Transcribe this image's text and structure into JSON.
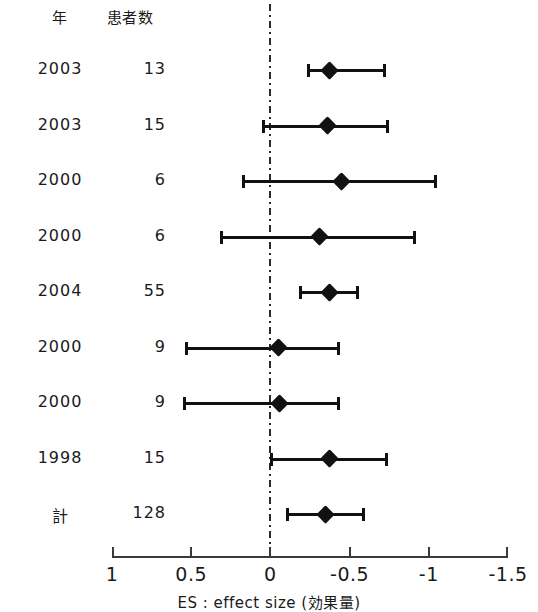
{
  "chart_data": {
    "type": "scatter",
    "subtype": "forest-plot",
    "title": "",
    "xlabel": "ES : effect size (効果量)",
    "ylabel": "",
    "xlim": [
      1,
      -1.5
    ],
    "x_reversed": true,
    "xticks": [
      1,
      0.5,
      0,
      -0.5,
      -1,
      -1.5
    ],
    "xticklabels": [
      "1",
      "0.5",
      "0",
      "-0.5",
      "-1",
      "-1.5"
    ],
    "grid": false,
    "legend": false,
    "reference_line": {
      "value": 0,
      "style": "dash-dot"
    },
    "columns": [
      "年",
      "患者数"
    ],
    "rows": [
      {
        "year": "2003",
        "n": "13",
        "estimate": -0.37,
        "ci_low": -0.23,
        "ci_high": -0.73,
        "is_total": false
      },
      {
        "year": "2003",
        "n": "15",
        "estimate": -0.36,
        "ci_low": 0.05,
        "ci_high": -0.75,
        "is_total": false
      },
      {
        "year": "2000",
        "n": "6",
        "estimate": -0.45,
        "ci_low": 0.18,
        "ci_high": -1.05,
        "is_total": false
      },
      {
        "year": "2000",
        "n": "6",
        "estimate": -0.31,
        "ci_low": 0.32,
        "ci_high": -0.92,
        "is_total": false
      },
      {
        "year": "2004",
        "n": "55",
        "estimate": -0.37,
        "ci_low": -0.18,
        "ci_high": -0.56,
        "is_total": false
      },
      {
        "year": "2000",
        "n": "9",
        "estimate": -0.05,
        "ci_low": 0.54,
        "ci_high": -0.44,
        "is_total": false
      },
      {
        "year": "2000",
        "n": "9",
        "estimate": -0.06,
        "ci_low": 0.55,
        "ci_high": -0.44,
        "is_total": false
      },
      {
        "year": "1998",
        "n": "15",
        "estimate": -0.37,
        "ci_low": 0.0,
        "ci_high": -0.74,
        "is_total": false
      },
      {
        "year": "計",
        "n": "128",
        "estimate": -0.35,
        "ci_low": -0.1,
        "ci_high": -0.6,
        "is_total": true
      }
    ]
  },
  "axis": {
    "caption": "ES : effect size (効果量)"
  },
  "header": {
    "year_label": "年",
    "n_label": "患者数"
  }
}
